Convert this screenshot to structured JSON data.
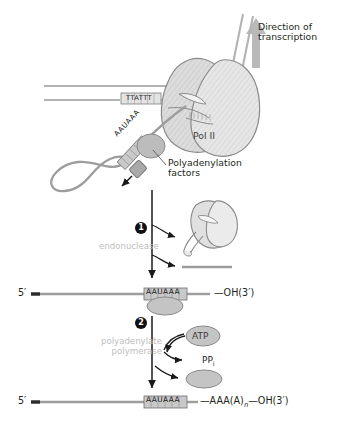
{
  "figure": {
    "colors": {
      "rna_line": "#9d9d9d",
      "dna_line": "#b3b3b3",
      "protein_fill": "#d9d9d9",
      "protein_stroke": "#8a8a8a",
      "factor_fill": "#bcbcbc",
      "arrow_black": "#1a1a1a",
      "arrow_gray": "#b0b0b0",
      "text": "#231f20",
      "muted_text": "#bdbdbd",
      "box_fill": "#c9c9c9"
    }
  },
  "top": {
    "direction_label_line1": "Direction of",
    "direction_label_line2": "transcription",
    "direction_arrow_icon": "up-arrow-icon",
    "dna_sequence_box": "TTATTT",
    "rna_signal_diagonal": "AAUAAA",
    "polymerase_label": "Pol II",
    "factors_label_line1": "Polyadenylation",
    "factors_label_line2": "factors"
  },
  "step1": {
    "number": "1",
    "enzyme_label": "endonuclease",
    "released_polymerase_icon": "pol-ii-shape-icon",
    "cleaved_fragment_icon": "rna-fragment-icon"
  },
  "product1": {
    "five_prime": "5′",
    "signal_box": "AAUAAA",
    "three_prime": "—OH(3′)"
  },
  "step2": {
    "number": "2",
    "enzyme_label_line1": "polyadenylate",
    "enzyme_label_line2": "polymerase",
    "substrate": "ATP",
    "product": "PP",
    "product_subscript": "i",
    "released_factor_icon": "polyadenylation-factor-icon"
  },
  "product2": {
    "five_prime": "5′",
    "signal_box": "AAUAAA",
    "poly_a_prefix": "—AAA(A)",
    "poly_a_subscript": "n",
    "three_prime": "—OH(3′)"
  }
}
